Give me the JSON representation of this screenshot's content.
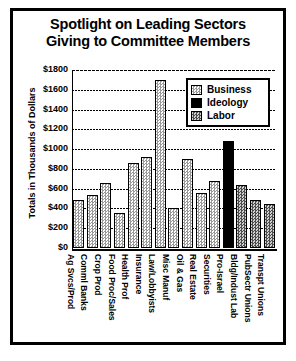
{
  "chart_data": {
    "type": "bar",
    "title": "Spotlight on Leading Sectors Giving to Committee Members",
    "title_lines": [
      "Spotlight on Leading Sectors",
      "Giving to Committee Members"
    ],
    "xlabel": "",
    "ylabel": "Totals in Thousands of Dollars",
    "ylim": [
      0,
      1800
    ],
    "ytick_values": [
      1800,
      1600,
      1400,
      1200,
      1000,
      800,
      600,
      400,
      200,
      0
    ],
    "ytick_labels": [
      "$1800",
      "$1600",
      "$1400",
      "$1200",
      "$1000",
      "$800",
      "$600",
      "$400",
      "$200",
      "$0"
    ],
    "grid": true,
    "grid_axis": "y",
    "legend_position": "upper right",
    "legend": [
      "Business",
      "Ideology",
      "Labor"
    ],
    "categories": [
      "Ag Svcs/Prod",
      "Comml Banks",
      "Crop Prod",
      "Food Proc/Sales",
      "Health Prof",
      "Insurance",
      "Law/Lobbyists",
      "Misc Manuf",
      "Oil & Gas",
      "Real Estate",
      "Securities",
      "Pro-Israel",
      "Bldg/Indust Lab",
      "PubSectr Unions",
      "Transpt Unions"
    ],
    "values": [
      490,
      540,
      660,
      350,
      860,
      920,
      1700,
      400,
      900,
      560,
      680,
      1080,
      640,
      490,
      450
    ],
    "groups": [
      "Business",
      "Business",
      "Business",
      "Business",
      "Business",
      "Business",
      "Business",
      "Business",
      "Business",
      "Business",
      "Business",
      "Ideology",
      "Labor",
      "Labor",
      "Labor"
    ],
    "bars": [
      {
        "category": "Ag Svcs/Prod",
        "value": 490,
        "group": "Business"
      },
      {
        "category": "Comml Banks",
        "value": 540,
        "group": "Business"
      },
      {
        "category": "Crop Prod",
        "value": 660,
        "group": "Business"
      },
      {
        "category": "Food Proc/Sales",
        "value": 350,
        "group": "Business"
      },
      {
        "category": "Health Prof",
        "value": 860,
        "group": "Business"
      },
      {
        "category": "Insurance",
        "value": 920,
        "group": "Business"
      },
      {
        "category": "Law/Lobbyists",
        "value": 1700,
        "group": "Business"
      },
      {
        "category": "Misc Manuf",
        "value": 400,
        "group": "Business"
      },
      {
        "category": "Oil & Gas",
        "value": 900,
        "group": "Business"
      },
      {
        "category": "Real Estate",
        "value": 560,
        "group": "Business"
      },
      {
        "category": "Securities",
        "value": 680,
        "group": "Business"
      },
      {
        "category": "Pro-Israel",
        "value": 1080,
        "group": "Ideology"
      },
      {
        "category": "Bldg/Indust Lab",
        "value": 640,
        "group": "Labor"
      },
      {
        "category": "PubSectr Unions",
        "value": 490,
        "group": "Labor"
      },
      {
        "category": "Transpt Unions",
        "value": 450,
        "group": "Labor"
      }
    ],
    "colors": {
      "business": "#c8c8c8",
      "ideology": "#000000",
      "labor": "#808080",
      "axis": "#000000",
      "background": "#ffffff"
    }
  }
}
